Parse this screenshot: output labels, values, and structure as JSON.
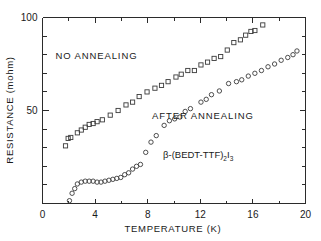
{
  "chart_data": {
    "type": "scatter",
    "title": "",
    "xlabel": "TEMPERATURE (K)",
    "ylabel": "RESISTANCE (mohm)",
    "xlim": [
      0,
      20
    ],
    "ylim": [
      0,
      100
    ],
    "xticks": [
      0,
      4,
      8,
      12,
      16,
      20
    ],
    "xtick_labels": [
      "0",
      "4",
      "8",
      "12",
      "16",
      "20"
    ],
    "xminor_step": 2,
    "yticks": [
      50,
      100
    ],
    "ytick_labels": [
      "50",
      "100"
    ],
    "yminor_step": 10,
    "grid": false,
    "legend_position": "inline-annotations",
    "annotations": [
      {
        "id": "no-annealing",
        "text": "NO ANNEALING",
        "x": 4.1,
        "y": 77.5
      },
      {
        "id": "after-annealing",
        "text": "AFTER ANNEALING",
        "x": 12.2,
        "y": 45.5
      },
      {
        "id": "compound-formula",
        "text": "β-(BEDT-TTF)2I3",
        "x": 9.3,
        "y": 29.5
      }
    ],
    "series": [
      {
        "name": "NO ANNEALING",
        "marker": "square",
        "points": [
          [
            1.75,
            31.0
          ],
          [
            1.95,
            35.0
          ],
          [
            2.15,
            35.5
          ],
          [
            2.65,
            38.0
          ],
          [
            2.95,
            39.5
          ],
          [
            3.25,
            41.0
          ],
          [
            3.55,
            42.5
          ],
          [
            3.85,
            43.0
          ],
          [
            4.15,
            44.0
          ],
          [
            4.55,
            45.0
          ],
          [
            5.15,
            47.5
          ],
          [
            5.75,
            50.0
          ],
          [
            6.35,
            53.0
          ],
          [
            6.85,
            54.5
          ],
          [
            7.35,
            57.5
          ],
          [
            7.95,
            60.0
          ],
          [
            8.55,
            62.0
          ],
          [
            9.05,
            63.5
          ],
          [
            9.55,
            65.5
          ],
          [
            10.15,
            68.0
          ],
          [
            10.55,
            69.5
          ],
          [
            11.05,
            71.5
          ],
          [
            11.55,
            71.5
          ],
          [
            12.05,
            74.5
          ],
          [
            12.55,
            76.0
          ],
          [
            13.05,
            78.0
          ],
          [
            13.55,
            79.0
          ],
          [
            14.05,
            82.5
          ],
          [
            14.55,
            86.5
          ],
          [
            15.05,
            88.0
          ],
          [
            15.45,
            90.5
          ],
          [
            15.85,
            92.5
          ],
          [
            16.15,
            93.0
          ],
          [
            16.75,
            96.0
          ]
        ]
      },
      {
        "name": "AFTER ANNEALING",
        "marker": "circle",
        "points": [
          [
            2.05,
            1.5
          ],
          [
            2.25,
            5.5
          ],
          [
            2.45,
            8.0
          ],
          [
            2.65,
            10.5
          ],
          [
            2.95,
            11.5
          ],
          [
            3.25,
            12.0
          ],
          [
            3.55,
            12.0
          ],
          [
            3.85,
            12.0
          ],
          [
            4.15,
            11.5
          ],
          [
            4.45,
            11.5
          ],
          [
            4.75,
            12.0
          ],
          [
            5.05,
            12.5
          ],
          [
            5.35,
            13.0
          ],
          [
            5.65,
            13.5
          ],
          [
            5.95,
            14.0
          ],
          [
            6.25,
            15.5
          ],
          [
            6.55,
            16.5
          ],
          [
            6.85,
            18.5
          ],
          [
            7.15,
            20.0
          ],
          [
            7.45,
            21.0
          ],
          [
            7.85,
            27.5
          ],
          [
            8.25,
            33.0
          ],
          [
            8.65,
            36.5
          ],
          [
            9.25,
            42.0
          ],
          [
            9.65,
            44.5
          ],
          [
            10.05,
            45.5
          ],
          [
            10.45,
            46.5
          ],
          [
            10.85,
            49.5
          ],
          [
            11.25,
            51.0
          ],
          [
            12.05,
            54.5
          ],
          [
            12.45,
            56.0
          ],
          [
            12.85,
            58.5
          ],
          [
            13.45,
            60.5
          ],
          [
            14.15,
            64.5
          ],
          [
            14.75,
            65.5
          ],
          [
            15.15,
            66.5
          ],
          [
            15.65,
            68.5
          ],
          [
            16.15,
            70.0
          ],
          [
            16.65,
            71.5
          ],
          [
            17.15,
            73.5
          ],
          [
            17.65,
            75.0
          ],
          [
            18.15,
            77.0
          ],
          [
            18.65,
            78.5
          ],
          [
            19.05,
            80.0
          ],
          [
            19.35,
            82.0
          ]
        ]
      }
    ]
  },
  "formula": {
    "greek": "β",
    "body": "-(BEDT-TTF)",
    "sub1": "2",
    "element": "I",
    "sub2": "3"
  }
}
